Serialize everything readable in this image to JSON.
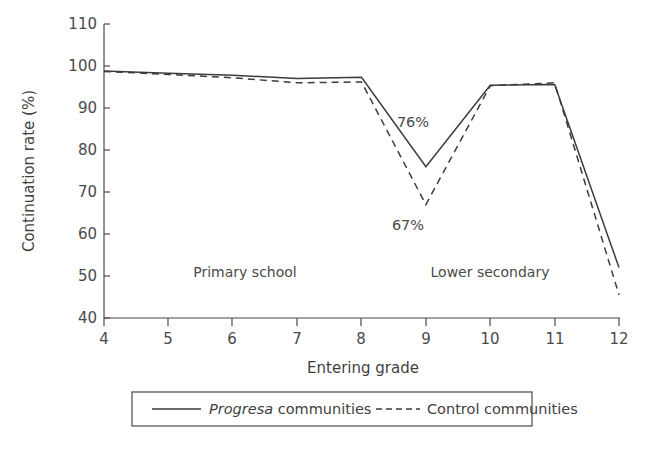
{
  "chart_data": {
    "type": "line",
    "title": "",
    "xlabel": "Entering grade",
    "ylabel": "Continuation rate (%)",
    "x": [
      4,
      5,
      6,
      7,
      8,
      9,
      10,
      11,
      12
    ],
    "xticklabels": [
      "4",
      "5",
      "6",
      "7",
      "8",
      "9",
      "10",
      "11",
      "12"
    ],
    "xlim": [
      4,
      12
    ],
    "ylim": [
      40,
      110
    ],
    "yticks": [
      40,
      50,
      60,
      70,
      80,
      90,
      100,
      110
    ],
    "yticklabels": [
      "40",
      "50",
      "60",
      "70",
      "80",
      "90",
      "100",
      "110"
    ],
    "grid": false,
    "legend_position": "below-axes",
    "series": [
      {
        "name": "Progresa communities",
        "style": "solid",
        "values": [
          98.8,
          98.3,
          97.8,
          97.0,
          97.3,
          76.0,
          95.4,
          95.6,
          52.0
        ]
      },
      {
        "name": "Control communities",
        "style": "dashed",
        "values": [
          98.7,
          98.0,
          97.2,
          96.0,
          96.2,
          67.0,
          95.3,
          96.0,
          45.5
        ]
      }
    ],
    "annotations": [
      {
        "text": "76%",
        "x": 9,
        "y": 84,
        "series": "Progresa communities"
      },
      {
        "text": "67%",
        "x": 9,
        "y": 59,
        "series": "Control communities"
      }
    ],
    "region_labels": [
      {
        "text": "Primary school",
        "x_center": 6.1,
        "y": 47
      },
      {
        "text": "Lower secondary",
        "x_center": 10.0,
        "y": 47
      }
    ]
  },
  "legend": {
    "entries": [
      {
        "label_italic": "Progresa",
        "label_rest": " communities",
        "style": "solid"
      },
      {
        "label_italic": "",
        "label_rest": "Control communities",
        "style": "dashed"
      }
    ]
  }
}
